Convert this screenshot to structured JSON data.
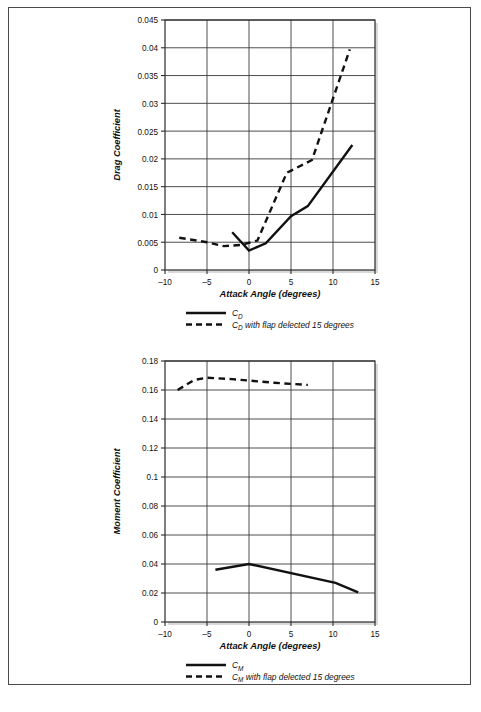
{
  "page": {
    "background": "#ffffff",
    "frame_color": "#4a4a4a"
  },
  "charts": [
    {
      "id": "drag-coefficient-chart",
      "ylabel": "Drag Coefficient",
      "xlabel": "Attack Angle (degrees)",
      "ytick_labels": [
        "0",
        "0.005",
        "0.01",
        "0.015",
        "0.02",
        "0.025",
        "0.03",
        "0.035",
        "0.04",
        "0.045"
      ],
      "xtick_labels": [
        "–10",
        "–5",
        "0",
        "5",
        "10",
        "15"
      ],
      "legend": [
        {
          "style": "solid",
          "label_main": "C",
          "label_sub": "D",
          "label_rest": ""
        },
        {
          "style": "dashed",
          "label_main": "C",
          "label_sub": "D",
          "label_rest": " with flap delected 15 degrees"
        }
      ]
    },
    {
      "id": "moment-coefficient-chart",
      "ylabel": "Moment Coefficient",
      "xlabel": "Attack Angle (degrees)",
      "ytick_labels": [
        "0",
        "0.02",
        "0.04",
        "0.06",
        "0.08",
        "0.1",
        "0.12",
        "0.14",
        "0.16",
        "0.18"
      ],
      "xtick_labels": [
        "–10",
        "–5",
        "0",
        "5",
        "10",
        "15"
      ],
      "legend": [
        {
          "style": "solid",
          "label_main": "C",
          "label_sub": "M",
          "label_rest": ""
        },
        {
          "style": "dashed",
          "label_main": "C",
          "label_sub": "M",
          "label_rest": " with flap delected 15 degrees"
        }
      ]
    }
  ],
  "chart_data": [
    {
      "type": "line",
      "id": "drag-coefficient-chart",
      "title": "",
      "xlabel": "Attack Angle (degrees)",
      "ylabel": "Drag Coefficient",
      "xlim": [
        -10,
        15
      ],
      "ylim": [
        0,
        0.045
      ],
      "xticks": [
        -10,
        -5,
        0,
        5,
        10,
        15
      ],
      "yticks": [
        0,
        0.005,
        0.01,
        0.015,
        0.02,
        0.025,
        0.03,
        0.035,
        0.04,
        0.045
      ],
      "grid": true,
      "legend_position": "below",
      "series": [
        {
          "name": "CD",
          "style": "solid",
          "color": "#111111",
          "x": [
            -2.0,
            0.0,
            2.0,
            5.0,
            7.0,
            12.3
          ],
          "y": [
            0.0068,
            0.0035,
            0.0048,
            0.0097,
            0.0115,
            0.0225
          ]
        },
        {
          "name": "CD with flap delected 15 degrees",
          "style": "dashed",
          "color": "#111111",
          "x": [
            -8.3,
            -5.0,
            -3.0,
            -1.0,
            1.0,
            4.5,
            7.5,
            12.0
          ],
          "y": [
            0.0058,
            0.005,
            0.0043,
            0.0045,
            0.0053,
            0.0175,
            0.0198,
            0.0397
          ]
        }
      ]
    },
    {
      "type": "line",
      "id": "moment-coefficient-chart",
      "title": "",
      "xlabel": "Attack Angle (degrees)",
      "ylabel": "Moment Coefficient",
      "xlim": [
        -10,
        15
      ],
      "ylim": [
        0,
        0.18
      ],
      "xticks": [
        -10,
        -5,
        0,
        5,
        10,
        15
      ],
      "yticks": [
        0,
        0.02,
        0.04,
        0.06,
        0.08,
        0.1,
        0.12,
        0.14,
        0.16,
        0.18
      ],
      "grid": true,
      "legend_position": "below",
      "series": [
        {
          "name": "CM",
          "style": "solid",
          "color": "#111111",
          "x": [
            -4.0,
            0.0,
            10.3,
            13.0
          ],
          "y": [
            0.036,
            0.04,
            0.027,
            0.0205
          ]
        },
        {
          "name": "CM with flap delected 15 degrees",
          "style": "dashed",
          "color": "#111111",
          "x": [
            -8.5,
            -6.5,
            -5.0,
            -2.0,
            0.0,
            3.0,
            5.0,
            7.0
          ],
          "y": [
            0.16,
            0.167,
            0.1685,
            0.1675,
            0.1665,
            0.165,
            0.1642,
            0.1635
          ]
        }
      ]
    }
  ]
}
